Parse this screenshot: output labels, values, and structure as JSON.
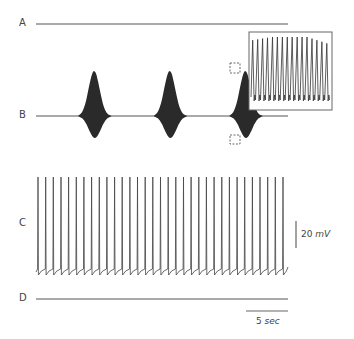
{
  "figure": {
    "traces": [
      {
        "id": "A",
        "label": "A",
        "description": "flat baseline"
      },
      {
        "id": "B",
        "label": "B",
        "description": "rhythmic bursts of oscillations (3 bursts)"
      },
      {
        "id": "C",
        "label": "C",
        "description": "regular tonic spiking"
      },
      {
        "id": "D",
        "label": "D",
        "description": "flat baseline"
      }
    ],
    "scale_bars": {
      "voltage": {
        "value": "20",
        "unit": "mV"
      },
      "time": {
        "value": "5",
        "unit": "sec"
      }
    },
    "inset": {
      "description": "expanded view of boxed burst region in trace B",
      "peak_count": 16
    }
  },
  "chart_data": {
    "type": "line",
    "title": "",
    "xlabel": "",
    "ylabel": "",
    "grid": false,
    "legend": "none",
    "series": [
      {
        "name": "A",
        "pattern": "flat",
        "x_range_sec": [
          0,
          36
        ]
      },
      {
        "name": "B",
        "pattern": "bursting",
        "burst_count": 3,
        "burst_centers_sec": [
          7,
          16,
          25
        ],
        "burst_duration_sec": 4.2,
        "burst_period_sec": 9
      },
      {
        "name": "C",
        "pattern": "tonic spiking",
        "spike_count": 33,
        "interspike_interval_sec": 0.87,
        "spike_amplitude_mV": 60
      },
      {
        "name": "D",
        "pattern": "flat",
        "x_range_sec": [
          0,
          36
        ]
      }
    ],
    "scale": {
      "voltage_bar_mV": 20,
      "time_bar_sec": 5
    },
    "annotations": [
      "20 mV",
      "5 sec",
      "inset: zoom of dashed region on third burst of B"
    ]
  }
}
